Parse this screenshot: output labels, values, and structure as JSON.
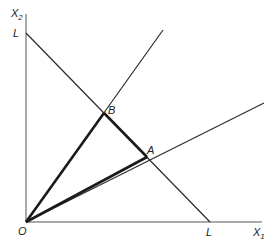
{
  "diagram": {
    "type": "geometric-construction",
    "colors": {
      "stroke": "#2a2a2a",
      "background": "#ffffff"
    },
    "axes": {
      "x": {
        "label": "X",
        "subscript": "1"
      },
      "y": {
        "label": "X",
        "subscript": "2"
      }
    },
    "labels": {
      "origin": "O",
      "l_on_y": "L",
      "l_on_x": "L",
      "point_a": "A",
      "point_b": "B"
    },
    "geometry": {
      "origin": [
        26,
        222
      ],
      "x_axis_end": [
        262,
        222
      ],
      "y_axis_end": [
        26,
        14
      ],
      "l_y": [
        26,
        33
      ],
      "l_x": [
        210,
        222
      ],
      "point_b": [
        104,
        113
      ],
      "point_a": [
        147,
        157
      ],
      "ray_upper_end": [
        163,
        30
      ],
      "ray_lower_end": [
        264,
        103
      ]
    }
  }
}
